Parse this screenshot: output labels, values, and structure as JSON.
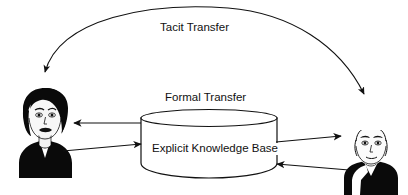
{
  "diagram": {
    "background_color": "#ffffff",
    "stroke_color": "#111111",
    "labels": {
      "tacit_transfer": "Tacit Transfer",
      "formal_transfer": "Formal Transfer",
      "knowledge_base": "Explicit Knowledge Base"
    },
    "nodes": [
      {
        "id": "person-left",
        "name": "person-left-portrait",
        "type": "photo-silhouette",
        "description": "High-contrast black and white portrait of a woman with short dark bobbed hair wearing a dark jacket",
        "position": {
          "x": 18,
          "y": 86,
          "width": 55,
          "height": 92
        }
      },
      {
        "id": "person-right",
        "name": "person-right-portrait",
        "type": "photo-silhouette",
        "description": "High-contrast black and white portrait of a person with short hair wearing a dark collared jacket",
        "position": {
          "x": 340,
          "y": 130,
          "width": 62,
          "height": 65
        }
      },
      {
        "id": "knowledge-base",
        "name": "explicit-knowledge-base-cylinder",
        "type": "database-cylinder",
        "label": "Explicit Knowledge Base",
        "position": {
          "x": 141,
          "y": 110,
          "width": 136,
          "height": 68
        }
      }
    ],
    "connectors": [
      {
        "id": "tacit-arc",
        "name": "tacit-transfer-arc",
        "label": "Tacit Transfer",
        "style": "curved",
        "arrowheads": "both",
        "from": "person-right",
        "to": "person-left"
      },
      {
        "id": "kb-to-left",
        "name": "kb-to-person-left-arrow",
        "style": "straight",
        "arrowheads": "end",
        "from": "knowledge-base",
        "to": "person-left"
      },
      {
        "id": "left-to-kb",
        "name": "person-left-to-kb-arrow",
        "style": "straight",
        "arrowheads": "end",
        "from": "person-left",
        "to": "knowledge-base"
      },
      {
        "id": "kb-to-right",
        "name": "kb-to-person-right-arrow",
        "style": "straight",
        "arrowheads": "end",
        "from": "knowledge-base",
        "to": "person-right"
      },
      {
        "id": "right-to-kb",
        "name": "person-right-to-kb-arrow",
        "style": "straight",
        "arrowheads": "end",
        "from": "person-right",
        "to": "knowledge-base"
      }
    ]
  }
}
